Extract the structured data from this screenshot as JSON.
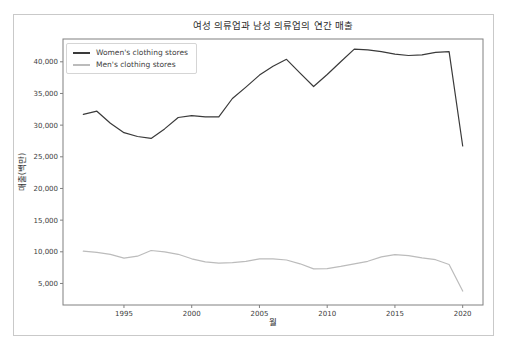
{
  "figure": {
    "title": "여성 의류업과 남성 의류업의 연간 매출",
    "xlabel": "월",
    "ylabel": "매출(백만)"
  },
  "chart_data": {
    "type": "line",
    "title": "여성 의류업과 남성 의류업의 연간 매출",
    "xlabel": "월",
    "ylabel": "매출(백만)",
    "grid": false,
    "legend_position": "upper-left",
    "xlim": [
      1990.5,
      2021.5
    ],
    "ylim": [
      1600,
      43600
    ],
    "x_tick_values": [
      1995,
      2000,
      2005,
      2010,
      2015,
      2020
    ],
    "x_tick_labels": [
      "1995",
      "2000",
      "2005",
      "2010",
      "2015",
      "2020"
    ],
    "y_tick_values": [
      5000,
      10000,
      15000,
      20000,
      25000,
      30000,
      35000,
      40000
    ],
    "y_tick_labels": [
      "5,000",
      "10,000",
      "15,000",
      "20,000",
      "25,000",
      "30,000",
      "35,000",
      "40,000"
    ],
    "x": [
      1992,
      1993,
      1994,
      1995,
      1996,
      1997,
      1998,
      1999,
      2000,
      2001,
      2002,
      2003,
      2004,
      2005,
      2006,
      2007,
      2008,
      2009,
      2010,
      2011,
      2012,
      2013,
      2014,
      2015,
      2016,
      2017,
      2018,
      2019,
      2020
    ],
    "series": [
      {
        "name": "Women's clothing stores",
        "color": "#3a3a3a",
        "values": [
          31700,
          32200,
          30300,
          28800,
          28200,
          27900,
          29400,
          31200,
          31500,
          31300,
          31300,
          34200,
          36000,
          37900,
          39300,
          40400,
          38200,
          36100,
          38000,
          40000,
          42000,
          41900,
          41600,
          41200,
          41000,
          41100,
          41500,
          41600,
          26700
        ]
      },
      {
        "name": "Men's clothing stores",
        "color": "#bcbcbc",
        "values": [
          10100,
          9900,
          9600,
          9000,
          9300,
          10200,
          10000,
          9600,
          8900,
          8400,
          8200,
          8300,
          8500,
          8900,
          8900,
          8700,
          8100,
          7300,
          7350,
          7700,
          8100,
          8500,
          9200,
          9550,
          9400,
          9050,
          8750,
          8000,
          3800
        ]
      }
    ],
    "spine_color": "#808080",
    "tick_color": "#808080"
  }
}
